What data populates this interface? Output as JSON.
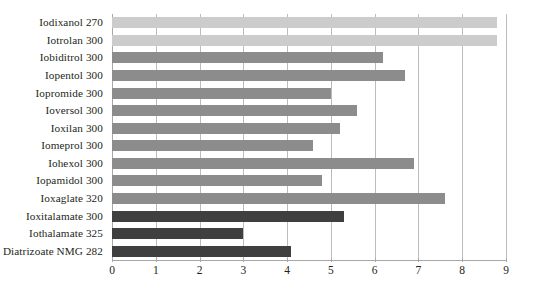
{
  "chart_data": {
    "type": "bar",
    "orientation": "horizontal",
    "title": "",
    "subtitle": "",
    "xlabel": "",
    "ylabel": "",
    "xlim": [
      0,
      9
    ],
    "ylim": null,
    "grid": true,
    "grid_axis": "x",
    "legend": false,
    "legend_position": "none",
    "xticks": [
      0,
      1,
      2,
      3,
      4,
      5,
      6,
      7,
      8,
      9
    ],
    "xtick_labels": [
      "0",
      "1",
      "2",
      "3",
      "4",
      "5",
      "6",
      "7",
      "8",
      "9"
    ],
    "categories": [
      "Iodixanol 270",
      "Iotrolan 300",
      "Iobiditrol 300",
      "Iopentol 300",
      "Iopromide 300",
      "Ioversol 300",
      "Ioxilan 300",
      "Iomeprol 300",
      "Iohexol 300",
      "Iopamidol 300",
      "Ioxaglate 320",
      "Ioxitalamate  300",
      "Iothalamate 325",
      "Diatrizoate NMG 282"
    ],
    "values": [
      8.8,
      8.8,
      6.2,
      6.7,
      5.0,
      5.6,
      5.2,
      4.6,
      6.9,
      4.8,
      7.6,
      5.3,
      3.0,
      4.1
    ],
    "bar_colors": [
      "#cccccc",
      "#cccccc",
      "#8c8c8c",
      "#8c8c8c",
      "#8c8c8c",
      "#8c8c8c",
      "#8c8c8c",
      "#8c8c8c",
      "#8c8c8c",
      "#8c8c8c",
      "#8c8c8c",
      "#3f3f3f",
      "#3f3f3f",
      "#3f3f3f"
    ],
    "colors": {
      "light_gray": "#cccccc",
      "medium_gray": "#8c8c8c",
      "dark_gray": "#3f3f3f",
      "gridline": "#bcbcbc",
      "axis": "#a8a8a8",
      "text": "#231f20",
      "background": "#ffffff"
    }
  }
}
